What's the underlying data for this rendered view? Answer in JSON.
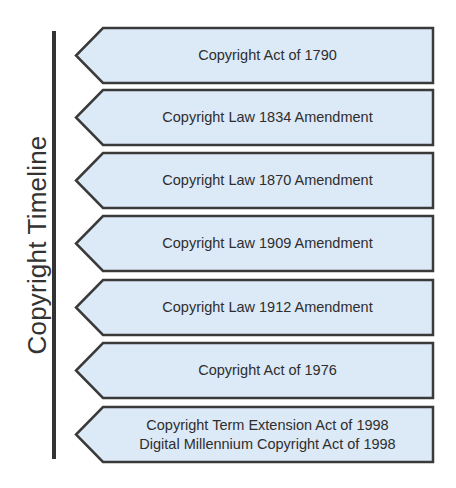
{
  "diagram": {
    "title": "Copyright Timeline",
    "colors": {
      "box_fill": "#dce9f7",
      "box_stroke": "#3a3a3a",
      "axis": "#333333",
      "text": "#2e2e2e"
    },
    "entries": [
      {
        "label": "Copyright Act of 1790",
        "top": 27
      },
      {
        "label": "Copyright Law 1834 Amendment",
        "top": 89
      },
      {
        "label": "Copyright Law 1870 Amendment",
        "top": 152
      },
      {
        "label": "Copyright Law 1909 Amendment",
        "top": 215
      },
      {
        "label": "Copyright Law 1912 Amendment",
        "top": 279
      },
      {
        "label": "Copyright Act of 1976",
        "top": 342
      },
      {
        "label": "Copyright Term Extension Act of 1998\nDigital Millennium Copyright Act of 1998",
        "top": 406
      }
    ]
  }
}
